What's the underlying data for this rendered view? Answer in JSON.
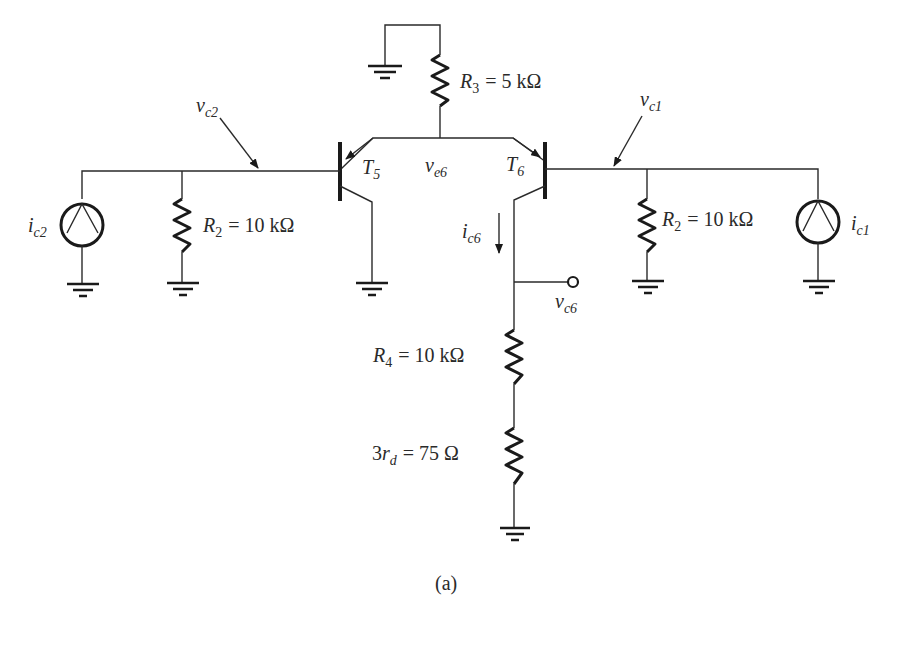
{
  "figure": {
    "caption": "(a)",
    "type": "circuit-schematic"
  },
  "components": {
    "R3": {
      "symbol": "R",
      "sub": "3",
      "value": "= 5 kΩ"
    },
    "R2_left": {
      "symbol": "R",
      "sub": "2",
      "value": "= 10 kΩ"
    },
    "R2_right": {
      "symbol": "R",
      "sub": "2",
      "value": "= 10 kΩ"
    },
    "R4": {
      "symbol": "R",
      "sub": "4",
      "value": "= 10 kΩ"
    },
    "rd": {
      "prefix": "3",
      "symbol": "r",
      "sub": "d",
      "value": "= 75 Ω"
    },
    "T5": {
      "symbol": "T",
      "sub": "5"
    },
    "T6": {
      "symbol": "T",
      "sub": "6"
    },
    "ic2": {
      "symbol": "i",
      "sub": "c2"
    },
    "ic1": {
      "symbol": "i",
      "sub": "c1"
    }
  },
  "nodes": {
    "vc2": {
      "symbol": "v",
      "sub": "c2"
    },
    "vc1": {
      "symbol": "v",
      "sub": "c1"
    },
    "ve6": {
      "symbol": "v",
      "sub": "e6"
    },
    "vc6": {
      "symbol": "v",
      "sub": "c6"
    }
  },
  "currents": {
    "ic6": {
      "symbol": "i",
      "sub": "c6"
    }
  }
}
